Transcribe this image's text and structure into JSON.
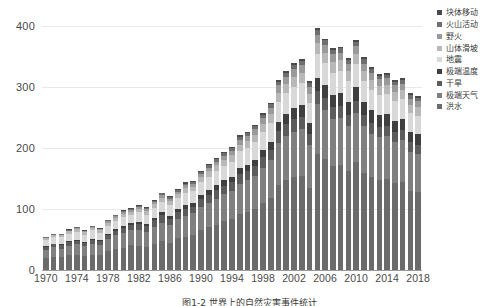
{
  "caption": "图1-2  世界上的自然灾害事件统计",
  "axes": {
    "yticks": [
      0,
      100,
      200,
      300,
      400
    ],
    "ylim": [
      0,
      430
    ],
    "xtick_labels": [
      "1970",
      "1974",
      "1978",
      "1982",
      "1986",
      "1990",
      "1994",
      "1998",
      "2002",
      "2006",
      "2010",
      "2014",
      "2018"
    ]
  },
  "legend": {
    "position": "right",
    "items": [
      {
        "label": "块体移动",
        "color": "#4a4a4a"
      },
      {
        "label": "火山活动",
        "color": "#6e6e6e"
      },
      {
        "label": "野火",
        "color": "#9a9a9a"
      },
      {
        "label": "山体滑坡",
        "color": "#b8b8b8"
      },
      {
        "label": "地震",
        "color": "#d8d8d8"
      },
      {
        "label": "极端温度",
        "color": "#3f3f3f"
      },
      {
        "label": "干旱",
        "color": "#5c5c5c"
      },
      {
        "label": "极端天气",
        "color": "#808080"
      },
      {
        "label": "洪水",
        "color": "#6b6b6b"
      }
    ]
  },
  "chart_data": {
    "type": "bar",
    "stacked": true,
    "title": "",
    "xlabel": "",
    "ylabel": "",
    "ylim": [
      0,
      430
    ],
    "grid": true,
    "categories": [
      1970,
      1971,
      1972,
      1973,
      1974,
      1975,
      1976,
      1977,
      1978,
      1979,
      1980,
      1981,
      1982,
      1983,
      1984,
      1985,
      1986,
      1987,
      1988,
      1989,
      1990,
      1991,
      1992,
      1993,
      1994,
      1995,
      1996,
      1997,
      1998,
      1999,
      2000,
      2001,
      2002,
      2003,
      2004,
      2005,
      2006,
      2007,
      2008,
      2009,
      2010,
      2011,
      2012,
      2013,
      2014,
      2015,
      2016,
      2017,
      2018
    ],
    "series": [
      {
        "name": "洪水",
        "color": "#6b6b6b",
        "values": [
          19,
          22,
          21,
          24,
          25,
          23,
          25,
          24,
          31,
          35,
          36,
          41,
          40,
          38,
          43,
          48,
          45,
          52,
          55,
          58,
          66,
          70,
          74,
          80,
          84,
          92,
          95,
          100,
          110,
          118,
          140,
          148,
          152,
          155,
          135,
          190,
          182,
          170,
          172,
          162,
          178,
          160,
          152,
          148,
          150,
          142,
          145,
          130,
          128
        ]
      },
      {
        "name": "极端天气",
        "color": "#808080",
        "values": [
          14,
          15,
          14,
          16,
          17,
          16,
          17,
          17,
          20,
          22,
          24,
          25,
          26,
          25,
          27,
          30,
          29,
          32,
          34,
          35,
          38,
          40,
          42,
          44,
          46,
          50,
          52,
          54,
          58,
          62,
          68,
          72,
          74,
          76,
          70,
          82,
          80,
          78,
          78,
          74,
          80,
          76,
          72,
          70,
          70,
          68,
          68,
          64,
          62
        ]
      },
      {
        "name": "干旱",
        "color": "#5c5c5c",
        "values": [
          5,
          5,
          6,
          6,
          6,
          5,
          7,
          6,
          6,
          7,
          9,
          8,
          9,
          9,
          12,
          12,
          10,
          11,
          12,
          11,
          12,
          13,
          15,
          14,
          14,
          16,
          15,
          16,
          17,
          17,
          20,
          20,
          22,
          20,
          18,
          22,
          21,
          20,
          20,
          19,
          20,
          19,
          18,
          17,
          17,
          17,
          17,
          16,
          16
        ]
      },
      {
        "name": "极端温度",
        "color": "#3f3f3f",
        "values": [
          1,
          1,
          1,
          2,
          2,
          2,
          2,
          2,
          3,
          3,
          3,
          3,
          4,
          4,
          4,
          5,
          5,
          5,
          6,
          6,
          7,
          8,
          8,
          9,
          9,
          10,
          10,
          11,
          12,
          13,
          15,
          16,
          18,
          20,
          18,
          22,
          20,
          20,
          21,
          20,
          23,
          21,
          20,
          19,
          19,
          18,
          18,
          17,
          17
        ]
      },
      {
        "name": "地震",
        "color": "#d8d8d8",
        "values": [
          10,
          11,
          12,
          12,
          13,
          12,
          14,
          12,
          13,
          14,
          15,
          14,
          16,
          15,
          16,
          17,
          17,
          18,
          19,
          19,
          21,
          22,
          23,
          24,
          25,
          27,
          28,
          29,
          30,
          32,
          33,
          34,
          35,
          36,
          33,
          38,
          37,
          36,
          36,
          35,
          37,
          35,
          34,
          33,
          33,
          32,
          32,
          30,
          30
        ]
      },
      {
        "name": "山体滑坡",
        "color": "#b8b8b8",
        "values": [
          3,
          3,
          3,
          4,
          4,
          4,
          4,
          4,
          5,
          5,
          5,
          5,
          6,
          6,
          6,
          7,
          7,
          7,
          8,
          8,
          9,
          9,
          10,
          10,
          11,
          11,
          12,
          12,
          13,
          14,
          15,
          15,
          16,
          16,
          15,
          18,
          17,
          17,
          17,
          16,
          17,
          16,
          16,
          15,
          15,
          15,
          15,
          14,
          14
        ]
      },
      {
        "name": "野火",
        "color": "#9a9a9a",
        "values": [
          1,
          1,
          1,
          1,
          2,
          2,
          2,
          2,
          2,
          2,
          3,
          3,
          3,
          3,
          4,
          4,
          4,
          4,
          5,
          5,
          5,
          6,
          6,
          7,
          7,
          8,
          8,
          9,
          10,
          10,
          12,
          12,
          13,
          13,
          12,
          14,
          13,
          13,
          13,
          12,
          13,
          12,
          12,
          11,
          11,
          11,
          11,
          10,
          10
        ]
      },
      {
        "name": "火山活动",
        "color": "#6e6e6e",
        "values": [
          1,
          1,
          1,
          1,
          1,
          1,
          1,
          1,
          2,
          2,
          2,
          2,
          2,
          2,
          2,
          3,
          3,
          3,
          3,
          3,
          3,
          4,
          4,
          4,
          4,
          5,
          5,
          5,
          5,
          6,
          6,
          6,
          7,
          7,
          6,
          8,
          7,
          7,
          7,
          7,
          7,
          7,
          6,
          6,
          6,
          6,
          6,
          6,
          6
        ]
      },
      {
        "name": "块体移动",
        "color": "#4a4a4a",
        "values": [
          1,
          1,
          1,
          1,
          1,
          1,
          1,
          1,
          1,
          1,
          1,
          1,
          1,
          1,
          1,
          1,
          1,
          1,
          2,
          2,
          2,
          2,
          2,
          2,
          2,
          2,
          2,
          2,
          3,
          3,
          3,
          3,
          3,
          3,
          3,
          4,
          3,
          3,
          3,
          3,
          3,
          3,
          3,
          3,
          3,
          3,
          3,
          3,
          3
        ]
      }
    ]
  }
}
